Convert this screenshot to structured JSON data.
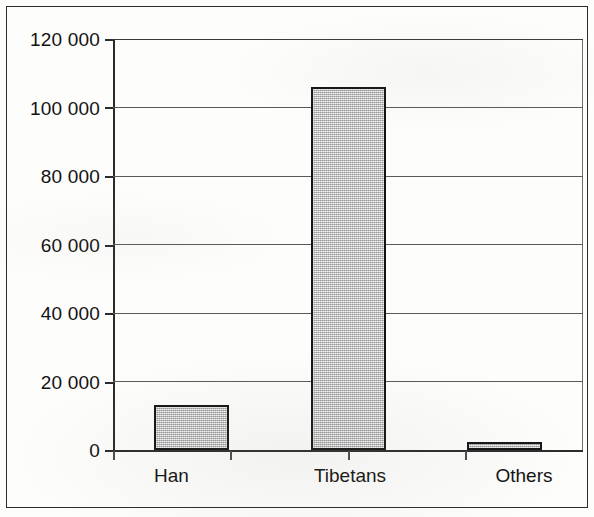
{
  "figure": {
    "frame_color": "#2b2b2b",
    "background_color": "#fdfdfc"
  },
  "chart_data": {
    "type": "bar",
    "title": "",
    "subtitle": "",
    "xlabel": "",
    "ylabel": "",
    "categories": [
      "Han",
      "Tibetans",
      "Others"
    ],
    "values": [
      13000,
      106000,
      2400
    ],
    "ylim": [
      0,
      120000
    ],
    "ytick_values": [
      0,
      20000,
      40000,
      60000,
      80000,
      100000,
      120000
    ],
    "ytick_labels": [
      "0",
      "20 000",
      "40 000",
      "60 000",
      "80 000",
      "100 000",
      "120 000"
    ],
    "grid": true,
    "grid_axis": "y",
    "legend": false,
    "legend_position": "none",
    "bar_fill_color": "#c4c4c4",
    "bar_edge_color": "#141414",
    "gridline_color": "#5a5a5a",
    "axis_color": "#2b2b2b",
    "annotations": []
  },
  "axis": {
    "y_labels": [
      {
        "text": "120 000",
        "value": 120000
      },
      {
        "text": "100 000",
        "value": 100000
      },
      {
        "text": "80 000",
        "value": 80000
      },
      {
        "text": "60 000",
        "value": 60000
      },
      {
        "text": "40 000",
        "value": 40000
      },
      {
        "text": "20 000",
        "value": 20000
      },
      {
        "text": "0",
        "value": 0
      }
    ]
  },
  "bars": [
    {
      "label": "Han",
      "value": 13000
    },
    {
      "label": "Tibetans",
      "value": 106000
    },
    {
      "label": "Others",
      "value": 2400
    }
  ]
}
